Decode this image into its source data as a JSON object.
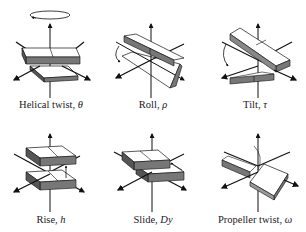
{
  "figure": {
    "colors": {
      "ink": "#111111",
      "block_top": "#ffffff",
      "block_side": "#777777",
      "background": "#ffffff"
    },
    "panels": [
      {
        "id": "helical-twist",
        "label": "Helical twist,",
        "symbol": "θ"
      },
      {
        "id": "roll",
        "label": "Roll,",
        "symbol": "ρ"
      },
      {
        "id": "tilt",
        "label": "Tilt,",
        "symbol": "τ"
      },
      {
        "id": "rise",
        "label": "Rise,",
        "symbol": "h"
      },
      {
        "id": "slide",
        "label": "Slide,",
        "symbol": "Dy"
      },
      {
        "id": "propeller-twist",
        "label": "Propeller twist,",
        "symbol": "ω"
      }
    ]
  }
}
